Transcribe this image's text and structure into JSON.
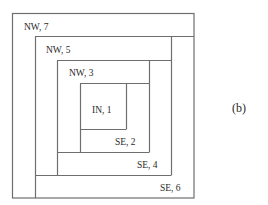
{
  "diagram": {
    "type": "nested-spiral-rectangles",
    "regions": [
      {
        "label": "NW, 7",
        "id": "nw7"
      },
      {
        "label": "NW, 5",
        "id": "nw5"
      },
      {
        "label": "NW, 3",
        "id": "nw3"
      },
      {
        "label": "IN, 1",
        "id": "in1"
      },
      {
        "label": "SE, 2",
        "id": "se2"
      },
      {
        "label": "SE, 4",
        "id": "se4"
      },
      {
        "label": "SE, 6",
        "id": "se6"
      }
    ],
    "caption": "(b)",
    "colors": {
      "line": "#6e6e6e",
      "text": "#2a2a2a",
      "background": "#ffffff"
    }
  }
}
